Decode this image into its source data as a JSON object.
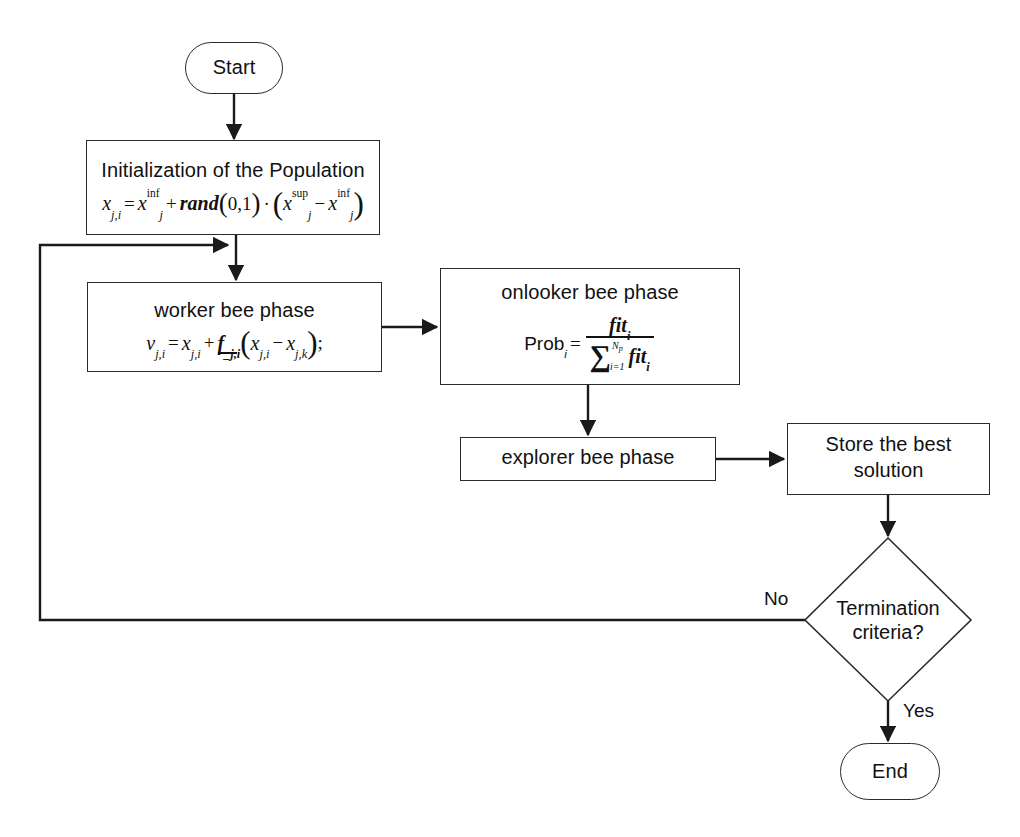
{
  "diagram": {
    "type": "flowchart",
    "background_color": "#ffffff",
    "stroke_color": "#2b2b2b",
    "text_color": "#111111"
  },
  "nodes": {
    "start": {
      "label": "Start",
      "shape": "terminator"
    },
    "initialization": {
      "label": "Initialization of the Population",
      "shape": "process",
      "formula": {
        "lhs_var": "x",
        "lhs_sub": "j,i",
        "eq": "=",
        "t1_var": "x",
        "t1_sub": "j",
        "t1_sup": "inf",
        "plus": "+",
        "func": "rand",
        "arg_open": "(",
        "arg": "0,1",
        "arg_close": ")",
        "dot": "·",
        "g_open": "(",
        "t2_var": "x",
        "t2_sub": "j",
        "t2_sup": "sup",
        "minus": "−",
        "t3_var": "x",
        "t3_sub": "j",
        "t3_sup": "inf",
        "g_close": ")"
      }
    },
    "worker": {
      "label": "worker bee phase",
      "shape": "process",
      "formula": {
        "lhs_var": "v",
        "lhs_sub": "j,i",
        "eq": "=",
        "t1_var": "x",
        "t1_sub": "j,i",
        "plus": "+",
        "f_var": "f",
        "f_sub": "_j,i",
        "g_open": "(",
        "t2_var": "x",
        "t2_sub": "j,i",
        "minus": "−",
        "t3_var": "x",
        "t3_sub": "j,k",
        "g_close": ")",
        "semicolon": ";"
      }
    },
    "onlooker": {
      "label": "onlooker bee phase",
      "formula": {
        "lhs_name": "Prob",
        "lhs_sub": "i",
        "eq": "=",
        "num_var": "fit",
        "num_sub": "i",
        "sigma": "∑",
        "sigma_upper": "N",
        "sigma_upper_sub": "p",
        "sigma_lower": "i=1",
        "den_var": "fit",
        "den_sub": "i"
      },
      "shape": "process"
    },
    "explorer": {
      "label": "explorer bee phase",
      "shape": "process"
    },
    "store": {
      "label": "Store the best",
      "label2": "solution",
      "shape": "process"
    },
    "termination": {
      "label": "Termination",
      "label2": "criteria?",
      "shape": "decision"
    },
    "end": {
      "label": "End",
      "shape": "terminator"
    }
  },
  "edge_labels": {
    "no": "No",
    "yes": "Yes"
  }
}
